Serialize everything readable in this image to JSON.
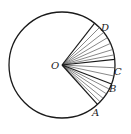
{
  "diagram": {
    "center": {
      "label": "O",
      "x": 62,
      "y": 65
    },
    "radius": 53,
    "stroke_color": "#1a1a1a",
    "thin_ray_color": "#555555",
    "points": [
      {
        "label": "A",
        "angle_deg": 48,
        "bold": true,
        "label_x": 92,
        "label_y": 116
      },
      {
        "label": "B",
        "angle_deg": 21,
        "bold": true,
        "label_x": 109,
        "label_y": 92
      },
      {
        "label": "C",
        "angle_deg": -6,
        "bold": true,
        "label_x": 114,
        "label_y": 75
      },
      {
        "label": "D",
        "angle_deg": -52,
        "bold": true,
        "label_x": 101,
        "label_y": 31
      }
    ],
    "intermediate_ray_angles_deg": [
      -45,
      -38,
      -31,
      -24,
      -17,
      -11,
      3,
      12,
      27,
      33,
      39,
      44
    ]
  }
}
